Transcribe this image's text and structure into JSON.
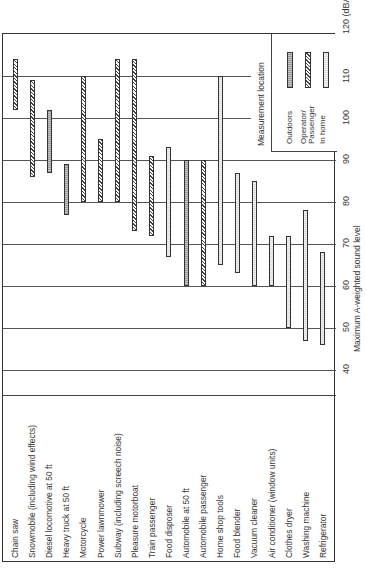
{
  "chart_data": {
    "type": "bar",
    "orientation": "range-bars, figure rotated 90deg counter-clockwise",
    "title": "",
    "xlabel": "",
    "ylabel": "Maximum A-weighted sound level",
    "unit": "(dBA)",
    "ylim": [
      40,
      120
    ],
    "ticks": [
      40,
      50,
      60,
      70,
      80,
      90,
      100,
      110,
      120
    ],
    "grid": true,
    "legend_title": "Measurement location",
    "legend": [
      {
        "key": "outdoors",
        "label": "Outdoors"
      },
      {
        "key": "operator",
        "label": "Operator/ Passenger"
      },
      {
        "key": "home",
        "label": "In home"
      }
    ],
    "categories": [
      "Chain saw",
      "Snowmobile (including wind effects)",
      "Diesel locomotive at 50 ft",
      "Heavy truck at 50 ft",
      "Motorcycle",
      "Power lawnmower",
      "Subway (including screech noise)",
      "Pleasure motorboat",
      "Train passenger",
      "Food disposer",
      "Automobile at 50 ft",
      "Automobile passenger",
      "Home shop tools",
      "Food blender",
      "Vacuum cleaner",
      "Air conditioner (window units)",
      "Clothes dryer",
      "Washing machine",
      "Refrigerator"
    ],
    "ranges": [
      {
        "label": "Chain saw",
        "min": 102,
        "max": 114,
        "location": "operator"
      },
      {
        "label": "Snowmobile (including wind effects)",
        "min": 86,
        "max": 109,
        "location": "operator"
      },
      {
        "label": "Diesel locomotive at 50 ft",
        "min": 87,
        "max": 102,
        "location": "outdoors"
      },
      {
        "label": "Heavy truck at 50 ft",
        "min": 77,
        "max": 89,
        "location": "outdoors"
      },
      {
        "label": "Motorcycle",
        "min": 80,
        "max": 110,
        "location": "operator"
      },
      {
        "label": "Power lawnmower",
        "min": 80,
        "max": 95,
        "location": "operator"
      },
      {
        "label": "Subway (including screech noise)",
        "min": 80,
        "max": 114,
        "location": "operator"
      },
      {
        "label": "Pleasure motorboat",
        "min": 73,
        "max": 114,
        "location": "operator"
      },
      {
        "label": "Train passenger",
        "min": 72,
        "max": 91,
        "location": "operator"
      },
      {
        "label": "Food disposer",
        "min": 67,
        "max": 93,
        "location": "home"
      },
      {
        "label": "Automobile at 50 ft",
        "min": 60,
        "max": 90,
        "location": "outdoors"
      },
      {
        "label": "Automobile passenger",
        "min": 60,
        "max": 90,
        "location": "operator"
      },
      {
        "label": "Home shop tools",
        "min": 65,
        "max": 110,
        "location": "home"
      },
      {
        "label": "Food blender",
        "min": 63,
        "max": 87,
        "location": "home"
      },
      {
        "label": "Vacuum cleaner",
        "min": 60,
        "max": 85,
        "location": "home"
      },
      {
        "label": "Air conditioner (window units)",
        "min": 60,
        "max": 72,
        "location": "home"
      },
      {
        "label": "Clothes dryer",
        "min": 50,
        "max": 72,
        "location": "home"
      },
      {
        "label": "Washing machine",
        "min": 47,
        "max": 78,
        "location": "home"
      },
      {
        "label": "Refrigerator",
        "min": 46,
        "max": 68,
        "location": "home"
      }
    ]
  }
}
